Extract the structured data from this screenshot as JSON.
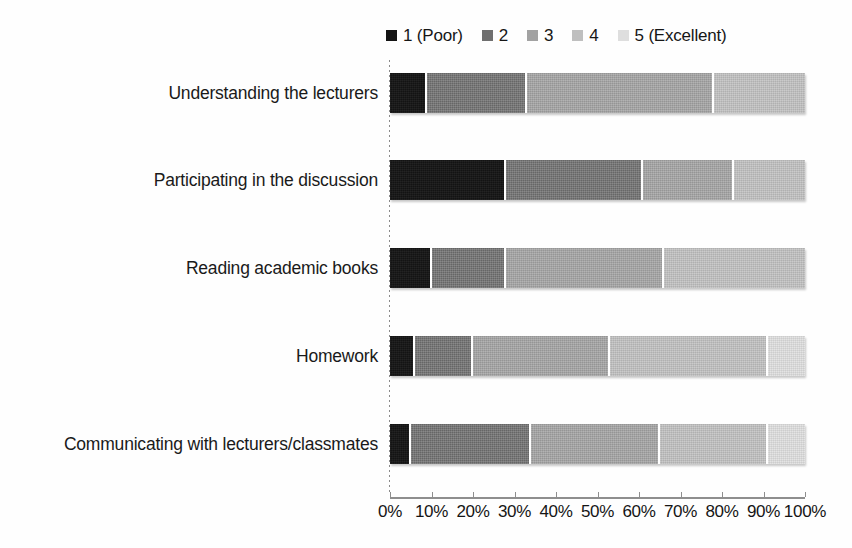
{
  "chart_data": {
    "type": "bar",
    "orientation": "horizontal",
    "stacked": true,
    "normalized_percent": true,
    "title": "",
    "subtitle": "",
    "xlabel": "",
    "ylabel": "",
    "xlim": [
      0,
      100
    ],
    "xtick_labels": [
      "0%",
      "10%",
      "20%",
      "30%",
      "40%",
      "50%",
      "60%",
      "70%",
      "80%",
      "90%",
      "100%"
    ],
    "xtick_values": [
      0,
      10,
      20,
      30,
      40,
      50,
      60,
      70,
      80,
      90,
      100
    ],
    "grid": false,
    "legend_position": "top-right",
    "legend": [
      "1 (Poor)",
      "2",
      "3",
      "4",
      "5 (Excellent)"
    ],
    "series_colors": [
      "#141414",
      "#6f6f6f",
      "#a2a2a2",
      "#bfbfbf",
      "#dedede"
    ],
    "categories": [
      "Understanding the lecturers",
      "Participating in the discussion",
      "Reading academic books",
      "Homework",
      "Communicating with lecturers/classmates"
    ],
    "series": [
      {
        "name": "1 (Poor)",
        "values": [
          9,
          28,
          10,
          6,
          5
        ]
      },
      {
        "name": "2",
        "values": [
          24,
          33,
          18,
          14,
          29
        ]
      },
      {
        "name": "3",
        "values": [
          45,
          22,
          38,
          33,
          31
        ]
      },
      {
        "name": "4",
        "values": [
          22,
          17,
          34,
          38,
          26
        ]
      },
      {
        "name": "5 (Excellent)",
        "values": [
          0,
          0,
          0,
          9,
          9
        ]
      }
    ],
    "annotations": []
  },
  "legend": {
    "items": [
      {
        "label": "1 (Poor)",
        "swatch": "legend-swatch-1",
        "color": "#141414"
      },
      {
        "label": "2",
        "swatch": "legend-swatch-2",
        "color": "#6f6f6f"
      },
      {
        "label": "3",
        "swatch": "legend-swatch-3",
        "color": "#a2a2a2"
      },
      {
        "label": "4",
        "swatch": "legend-swatch-4",
        "color": "#bfbfbf"
      },
      {
        "label": "5 (Excellent)",
        "swatch": "legend-swatch-5",
        "color": "#dedede"
      }
    ]
  }
}
